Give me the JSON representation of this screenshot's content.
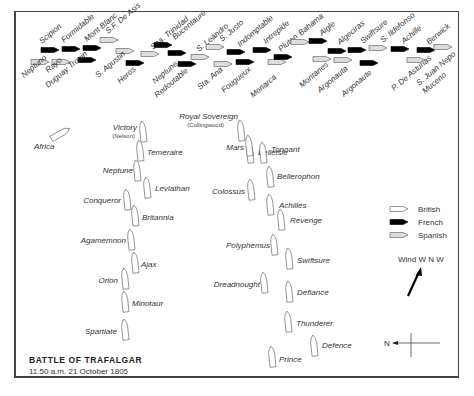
{
  "title": "BATTLE OF TRAFALGAR",
  "subtitle": "11.50 a.m. 21 October 1805",
  "colors": {
    "british_fill": "#ffffff",
    "french_fill": "#000000",
    "spanish_fill": "#dddddd",
    "outline": "#555555",
    "text": "#333333",
    "frame": "#444444"
  },
  "legend": {
    "items": [
      {
        "label": "British",
        "type": "british"
      },
      {
        "label": "French",
        "type": "french"
      },
      {
        "label": "Spanish",
        "type": "spanish"
      }
    ]
  },
  "wind": {
    "label": "Wind W N W"
  },
  "compass": {
    "label": "N"
  },
  "combined_fleet": [
    {
      "name": "Scipion",
      "type": "french",
      "x": 50,
      "y": 50,
      "lx": 42,
      "ly": 44,
      "rot": -40
    },
    {
      "name": "Formidable",
      "type": "french",
      "x": 71,
      "y": 49,
      "lx": 64,
      "ly": 43,
      "rot": -40
    },
    {
      "name": "Mont Blanc",
      "type": "french",
      "x": 92,
      "y": 48,
      "lx": 87,
      "ly": 42,
      "rot": -40
    },
    {
      "name": "S.F. De Asis",
      "type": "spanish",
      "x": 109,
      "y": 40,
      "lx": 108,
      "ly": 34,
      "rot": -40
    },
    {
      "name": "Neptuno",
      "type": "spanish",
      "x": 40,
      "y": 62,
      "lx": 24,
      "ly": 78,
      "rot": -40
    },
    {
      "name": "Rayo",
      "type": "spanish",
      "x": 61,
      "y": 62,
      "lx": 48,
      "ly": 73,
      "rot": -40
    },
    {
      "name": "Duguay Trouin",
      "type": "french",
      "x": 87,
      "y": 60,
      "lx": 48,
      "ly": 88,
      "rot": -40
    },
    {
      "name": "S. Agustin",
      "type": "spanish",
      "x": 125,
      "y": 51,
      "lx": 98,
      "ly": 78,
      "rot": -40
    },
    {
      "name": "Heros",
      "type": "french",
      "x": 135,
      "y": 63,
      "lx": 120,
      "ly": 84,
      "rot": -40
    },
    {
      "name": "Sna. Trinidad",
      "type": "spanish",
      "x": 150,
      "y": 54,
      "lx": 153,
      "ly": 50,
      "rot": -40
    },
    {
      "name": "Bucentaure",
      "type": "french",
      "x": 163,
      "y": 45,
      "lx": 175,
      "ly": 40,
      "rot": -40
    },
    {
      "name": "Neptune",
      "type": "french",
      "x": 177,
      "y": 53,
      "lx": 155,
      "ly": 84,
      "rot": -40
    },
    {
      "name": "Redoutable",
      "type": "french",
      "x": 187,
      "y": 64,
      "lx": 157,
      "ly": 98,
      "rot": -40
    },
    {
      "name": "S. Leandro",
      "type": "spanish",
      "x": 200,
      "y": 57,
      "lx": 199,
      "ly": 52,
      "rot": -40
    },
    {
      "name": "S. Justo",
      "type": "spanish",
      "x": 215,
      "y": 47,
      "lx": 222,
      "ly": 42,
      "rot": -40
    },
    {
      "name": "Sta. Ana",
      "type": "spanish",
      "x": 223,
      "y": 64,
      "lx": 200,
      "ly": 90,
      "rot": -40
    },
    {
      "name": "Indomptable",
      "type": "french",
      "x": 236,
      "y": 52,
      "lx": 240,
      "ly": 47,
      "rot": -40
    },
    {
      "name": "Fougueux",
      "type": "french",
      "x": 245,
      "y": 62,
      "lx": 224,
      "ly": 93,
      "rot": -40
    },
    {
      "name": "Intrepide",
      "type": "french",
      "x": 262,
      "y": 50,
      "lx": 266,
      "ly": 44,
      "rot": -40
    },
    {
      "name": "Monarca",
      "type": "spanish",
      "x": 277,
      "y": 62,
      "lx": 253,
      "ly": 98,
      "rot": -40
    },
    {
      "name": "Pluton",
      "type": "french",
      "x": 283,
      "y": 57,
      "lx": 281,
      "ly": 52,
      "rot": -40
    },
    {
      "name": "Bahama",
      "type": "spanish",
      "x": 300,
      "y": 42,
      "lx": 301,
      "ly": 36,
      "rot": -40
    },
    {
      "name": "Aigle",
      "type": "french",
      "x": 318,
      "y": 41,
      "lx": 322,
      "ly": 36,
      "rot": -40
    },
    {
      "name": "Montanes",
      "type": "spanish",
      "x": 322,
      "y": 59,
      "lx": 302,
      "ly": 88,
      "rot": -40
    },
    {
      "name": "Algeciras",
      "type": "french",
      "x": 337,
      "y": 51,
      "lx": 340,
      "ly": 45,
      "rot": -40
    },
    {
      "name": "Argonauta",
      "type": "spanish",
      "x": 343,
      "y": 60,
      "lx": 320,
      "ly": 93,
      "rot": -40
    },
    {
      "name": "Swiftsure",
      "type": "french",
      "x": 357,
      "y": 50,
      "lx": 363,
      "ly": 44,
      "rot": -40
    },
    {
      "name": "Argonaute",
      "type": "french",
      "x": 369,
      "y": 63,
      "lx": 344,
      "ly": 97,
      "rot": -40
    },
    {
      "name": "S. Ildefonso",
      "type": "spanish",
      "x": 378,
      "y": 48,
      "lx": 383,
      "ly": 43,
      "rot": -40
    },
    {
      "name": "Achille",
      "type": "french",
      "x": 400,
      "y": 49,
      "lx": 404,
      "ly": 44,
      "rot": -40
    },
    {
      "name": "P. De Asturias",
      "type": "spanish",
      "x": 416,
      "y": 60,
      "lx": 394,
      "ly": 91,
      "rot": -40
    },
    {
      "name": "Berwick",
      "type": "french",
      "x": 426,
      "y": 50,
      "lx": 429,
      "ly": 45,
      "rot": -40
    },
    {
      "name": "S. Juan Nepo",
      "type": "spanish",
      "x": 443,
      "y": 47,
      "lx": 419,
      "ly": 86,
      "rot": -40,
      "sub": "Muceno"
    }
  ],
  "british_fleet": [
    {
      "name": "Africa",
      "x": 60,
      "y": 134,
      "lx": 34,
      "ly": 149,
      "rot": -70,
      "anchor": "start"
    },
    {
      "name": "Victory",
      "sub": "(Nelson)",
      "x": 143,
      "y": 132,
      "lx": 137,
      "ly": 130,
      "anchor": "end"
    },
    {
      "name": "Temeraire",
      "x": 140,
      "y": 151,
      "lx": 147,
      "ly": 155,
      "anchor": "start"
    },
    {
      "name": "Neptune",
      "x": 137,
      "y": 171,
      "lx": 133,
      "ly": 173,
      "anchor": "end"
    },
    {
      "name": "Leviathan",
      "x": 147,
      "y": 188,
      "lx": 155,
      "ly": 191,
      "anchor": "start"
    },
    {
      "name": "Conqueror",
      "x": 127,
      "y": 200,
      "lx": 121,
      "ly": 203,
      "anchor": "end"
    },
    {
      "name": "Britannia",
      "x": 135,
      "y": 216,
      "lx": 142,
      "ly": 220,
      "anchor": "start"
    },
    {
      "name": "Agamemnon",
      "x": 131,
      "y": 240,
      "lx": 126,
      "ly": 243,
      "anchor": "end"
    },
    {
      "name": "Ajax",
      "x": 135,
      "y": 263,
      "lx": 141,
      "ly": 267,
      "anchor": "start"
    },
    {
      "name": "Orion",
      "x": 125,
      "y": 279,
      "lx": 118,
      "ly": 283,
      "anchor": "end"
    },
    {
      "name": "Minotaur",
      "x": 125,
      "y": 302,
      "lx": 132,
      "ly": 306,
      "anchor": "start"
    },
    {
      "name": "Spartiate",
      "x": 125,
      "y": 330,
      "lx": 117,
      "ly": 334,
      "anchor": "end"
    },
    {
      "name": "Royal Sovereign",
      "sub": "(Collingwood)",
      "x": 241,
      "y": 131,
      "lx": 238,
      "ly": 119,
      "anchor": "end"
    },
    {
      "name": "Belleisle",
      "x": 250,
      "y": 153,
      "lx": 258,
      "ly": 125,
      "anchor": "start",
      "lfix": true
    },
    {
      "name": "Mars",
      "x": 249,
      "y": 146,
      "lx": 244,
      "ly": 150,
      "anchor": "end"
    },
    {
      "name": "Tonnant",
      "x": 263,
      "y": 153,
      "lx": 271,
      "ly": 152,
      "anchor": "start"
    },
    {
      "name": "Bellerophon",
      "x": 270,
      "y": 177,
      "lx": 277,
      "ly": 179,
      "anchor": "start"
    },
    {
      "name": "Colossus",
      "x": 251,
      "y": 190,
      "lx": 245,
      "ly": 194,
      "anchor": "end"
    },
    {
      "name": "Achilles",
      "x": 270,
      "y": 205,
      "lx": 279,
      "ly": 208,
      "anchor": "start"
    },
    {
      "name": "Revenge",
      "x": 281,
      "y": 220,
      "lx": 290,
      "ly": 223,
      "anchor": "start"
    },
    {
      "name": "Polyphemus",
      "x": 274,
      "y": 245,
      "lx": 270,
      "ly": 248,
      "anchor": "end"
    },
    {
      "name": "Swiftsure",
      "x": 289,
      "y": 259,
      "lx": 297,
      "ly": 263,
      "anchor": "start"
    },
    {
      "name": "Dreadnought",
      "x": 264,
      "y": 283,
      "lx": 260,
      "ly": 287,
      "anchor": "end"
    },
    {
      "name": "Defiance",
      "x": 289,
      "y": 292,
      "lx": 297,
      "ly": 295,
      "anchor": "start"
    },
    {
      "name": "Thunderer",
      "x": 288,
      "y": 322,
      "lx": 296,
      "ly": 326,
      "anchor": "start"
    },
    {
      "name": "Defence",
      "x": 314,
      "y": 346,
      "lx": 322,
      "ly": 348,
      "anchor": "start"
    },
    {
      "name": "Prince",
      "x": 272,
      "y": 357,
      "lx": 279,
      "ly": 362,
      "anchor": "start"
    }
  ]
}
